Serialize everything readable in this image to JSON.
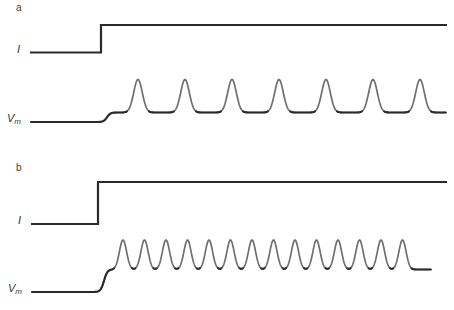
{
  "figure": {
    "background": "#ffffff",
    "width": 454,
    "height": 310
  },
  "chart_data": {
    "type": "line",
    "title": "",
    "xlabel": "",
    "ylabel": "",
    "legend": null,
    "grid": false,
    "colors": {
      "trace_primary": "#2a2a2a",
      "trace_spikes": "#6f6f6f",
      "label_text": "#3c3c3c"
    },
    "panels": [
      {
        "panel_label": "a",
        "current_label": "I",
        "vm_label": {
          "main": "V",
          "sub": "m"
        },
        "spike_count": 7,
        "current_trace": {
          "x_start": 30,
          "x_step": 101,
          "x_end": 447,
          "y_low": 52.5,
          "y_high": 25
        },
        "vm_trace": {
          "x_start": 31,
          "x_end": 446,
          "y_rest": 122,
          "y_plateau": 112.5,
          "step_x": 107,
          "step_scale": 1.7,
          "spike_peak_y": 79.5,
          "spike_sigma": 4.3,
          "spike_x": [
            138,
            185,
            232,
            279,
            326,
            373,
            420
          ]
        }
      },
      {
        "panel_label": "b",
        "current_label": "I",
        "vm_label": {
          "main": "V",
          "sub": "m"
        },
        "spike_count": 14,
        "current_trace": {
          "x_start": 31,
          "x_step": 98,
          "x_end": 447,
          "y_low": 224,
          "y_high": 182
        },
        "vm_trace": {
          "x_start": 32,
          "x_end": 431,
          "y_rest": 292,
          "y_plateau": 269.5,
          "step_x": 104,
          "step_scale": 1.7,
          "spike_peak_y": 240,
          "spike_sigma": 3.6,
          "spike_x": [
            123,
            144.5,
            166,
            187.5,
            209,
            230.5,
            252,
            273.5,
            295,
            316.5,
            338,
            359.5,
            381,
            402.5
          ]
        }
      }
    ]
  }
}
